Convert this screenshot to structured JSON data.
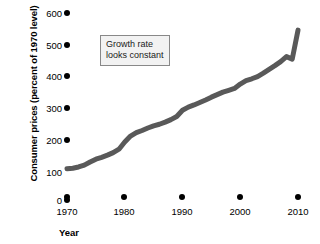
{
  "chart_data": {
    "type": "line",
    "title": "",
    "xlabel": "Year",
    "ylabel": "Consumer prices (percent of 1970 level)",
    "xlim": [
      1970,
      2010
    ],
    "ylim": [
      0,
      600
    ],
    "grid": false,
    "legend": "none",
    "yticks": [
      0,
      100,
      200,
      300,
      400,
      500,
      600
    ],
    "ytick_labels": [
      "0",
      "100",
      "200",
      "300",
      "400",
      "500",
      "600"
    ],
    "xticks": [
      1970,
      1980,
      1990,
      2000,
      2010
    ],
    "xtick_labels": [
      "1970",
      "1980",
      "1990",
      "2000",
      "2010"
    ],
    "series": [
      {
        "name": "Consumer prices",
        "color": "#595959",
        "linewidth": 5,
        "x": [
          1970,
          1971,
          1972,
          1973,
          1974,
          1975,
          1976,
          1977,
          1978,
          1979,
          1980,
          1981,
          1982,
          1983,
          1984,
          1985,
          1986,
          1987,
          1988,
          1989,
          1990,
          1991,
          1992,
          1993,
          1994,
          1995,
          1996,
          1997,
          1998,
          1999,
          2000,
          2001,
          2002,
          2003,
          2004,
          2005,
          2006,
          2007,
          2008,
          2009,
          2010
        ],
        "values": [
          100,
          102,
          106,
          112,
          122,
          131,
          137,
          144,
          152,
          163,
          186,
          205,
          216,
          223,
          231,
          238,
          243,
          250,
          258,
          268,
          288,
          298,
          305,
          313,
          321,
          330,
          338,
          346,
          352,
          358,
          372,
          383,
          389,
          396,
          407,
          419,
          431,
          444,
          460,
          452,
          545
        ]
      }
    ],
    "annotations": [
      {
        "name": "growth-rate-callout",
        "lines": [
          "Growth rate",
          "looks constant"
        ],
        "x": 100,
        "y": 35
      }
    ]
  }
}
